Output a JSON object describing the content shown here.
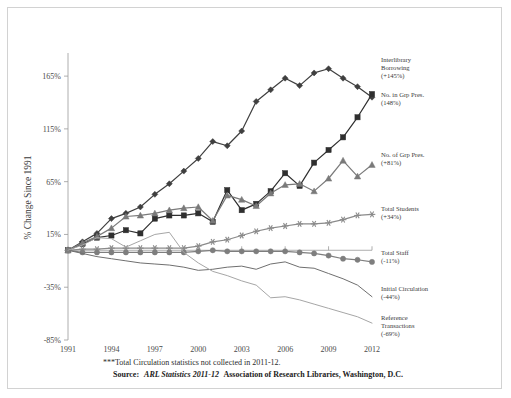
{
  "chart_data": {
    "type": "line",
    "title": "",
    "xlabel": "",
    "ylabel": "% Change Since 1991",
    "xlim": [
      1991,
      2012
    ],
    "ylim": [
      -85,
      185
    ],
    "grid": false,
    "legend_position": "right-inline-labels",
    "x_tick_labels": [
      "1991",
      "1994",
      "1997",
      "2000",
      "2003",
      "2006",
      "2009",
      "2012"
    ],
    "x_ticks": [
      1991,
      1994,
      1997,
      2000,
      2003,
      2006,
      2009,
      2012
    ],
    "y_tick_labels": [
      "165%",
      "115%",
      "65%",
      "15%",
      "-35%",
      "-85%"
    ],
    "y_ticks": [
      165,
      115,
      65,
      15,
      -35,
      -85
    ],
    "x": [
      1991,
      1992,
      1993,
      1994,
      1995,
      1996,
      1997,
      1998,
      1999,
      2000,
      2001,
      2002,
      2003,
      2004,
      2005,
      2006,
      2007,
      2008,
      2009,
      2010,
      2011,
      2012
    ],
    "series": [
      {
        "name": "Interlibrary Borrowing",
        "label": "Interlibrary Borrowing",
        "delta_label": "(+145%)",
        "final_value": 145,
        "marker": "diamond",
        "color": "#3f3f3f",
        "values": [
          0,
          8,
          16,
          30,
          35,
          41,
          53,
          63,
          75,
          87,
          103,
          99,
          113,
          141,
          152,
          163,
          156,
          168,
          172,
          163,
          155,
          145
        ]
      },
      {
        "name": "No. in Grp Pres.",
        "label": "No. in Grp Pres.",
        "delta_label": "(148%)",
        "final_value": 148,
        "marker": "square",
        "color": "#2f2f2f",
        "values": [
          0,
          6,
          12,
          14,
          19,
          16,
          30,
          33,
          33,
          35,
          27,
          57,
          38,
          44,
          56,
          73,
          61,
          83,
          95,
          107,
          126,
          148
        ]
      },
      {
        "name": "No. of Grp Pres.",
        "label": "No. of Grp Pres.",
        "delta_label": "(+81%)",
        "final_value": 81,
        "marker": "triangle",
        "color": "#7a7a7a",
        "values": [
          0,
          7,
          13,
          21,
          32,
          33,
          35,
          38,
          40,
          41,
          28,
          52,
          48,
          42,
          54,
          62,
          63,
          56,
          68,
          85,
          70,
          81
        ]
      },
      {
        "name": "Total Students",
        "label": "Total Students",
        "delta_label": "(+34%)",
        "final_value": 34,
        "marker": "star",
        "color": "#8a8a8a",
        "values": [
          0,
          1,
          1,
          2,
          2,
          2,
          2,
          2,
          2,
          4,
          8,
          10,
          14,
          18,
          21,
          23,
          25,
          25,
          26,
          29,
          33,
          34
        ]
      },
      {
        "name": "Total Staff",
        "label": "Total Staff",
        "delta_label": "(-11%)",
        "final_value": -11,
        "marker": "circle",
        "color": "#7e7e7e",
        "values": [
          0,
          -2,
          -2,
          -2,
          -2,
          -2,
          -2,
          -2,
          -2,
          -1,
          0,
          -1,
          -1,
          -1,
          -1,
          -1,
          -2,
          -3,
          -5,
          -8,
          -9,
          -11
        ]
      },
      {
        "name": "Initial Circulation",
        "label": "Initial Circulation",
        "delta_label": "(-44%)",
        "final_value": -44,
        "marker": "none",
        "color": "#6f6f6f",
        "values": [
          0,
          -3,
          -6,
          -8,
          -10,
          -12,
          -13,
          -14,
          -16,
          -19,
          -18,
          -16,
          -15,
          -18,
          -13,
          -11,
          -16,
          -17,
          -22,
          -27,
          -33,
          -44
        ]
      },
      {
        "name": "Reference Transactions",
        "label": "Reference Transactions",
        "delta_label": "(-69%)",
        "final_value": -69,
        "marker": "none",
        "color": "#a6a6a6",
        "values": [
          0,
          5,
          12,
          11,
          3,
          9,
          15,
          17,
          -2,
          -12,
          -20,
          -24,
          -29,
          -33,
          -45,
          -44,
          -47,
          -51,
          -55,
          -59,
          -63,
          -69
        ]
      }
    ]
  },
  "annotations": {
    "footnote": "***Total Circulation statistics not collected in 2011-12.",
    "source_prefix": "Source:",
    "source_italic": "ARL Statistics 2011-12",
    "source_suffix": "Association of Research Libraries, Washington, D.C."
  }
}
